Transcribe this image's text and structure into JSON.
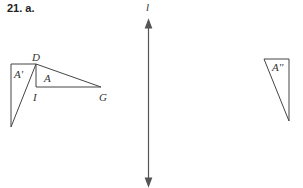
{
  "problem": {
    "label": "21. a."
  },
  "diagram": {
    "line_label": "l",
    "vertices": {
      "D": "D",
      "I": "I",
      "G": "G"
    },
    "figures": {
      "original": "A",
      "first_image": "A'",
      "second_image": "A''"
    }
  }
}
